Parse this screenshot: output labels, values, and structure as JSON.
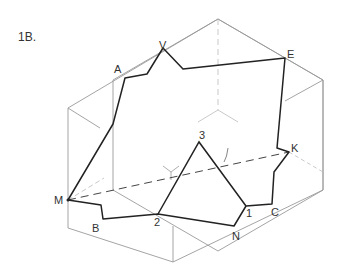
{
  "figure": {
    "title": "1B.",
    "labels": {
      "A": "A",
      "V": "V",
      "E": "E",
      "K": "K",
      "C": "C",
      "one": "1",
      "N": "N",
      "two": "2",
      "B": "B",
      "M": "M",
      "three": "3"
    }
  },
  "geometry": {
    "cube_hexagon": [
      [
        218,
        19
      ],
      [
        323,
        80
      ],
      [
        323,
        190
      ],
      [
        218,
        251
      ],
      [
        113,
        190
      ],
      [
        113,
        80
      ]
    ],
    "section_polygon": [
      [
        68,
        228
      ],
      [
        125,
        101
      ],
      [
        147,
        99
      ],
      [
        163,
        48
      ],
      [
        185,
        69
      ],
      [
        285,
        58
      ],
      [
        274,
        148
      ],
      [
        272,
        182
      ],
      [
        263,
        202
      ],
      [
        246,
        206
      ],
      [
        224,
        228
      ],
      [
        158,
        212
      ],
      [
        103,
        221
      ],
      [
        101,
        203
      ]
    ],
    "triangle": [
      [
        158,
        212
      ],
      [
        200,
        140
      ],
      [
        246,
        206
      ]
    ],
    "colors": {
      "outline": "#999999",
      "section": "#222222",
      "dashed": "#444444",
      "hidden": "#bbbbbb"
    }
  }
}
